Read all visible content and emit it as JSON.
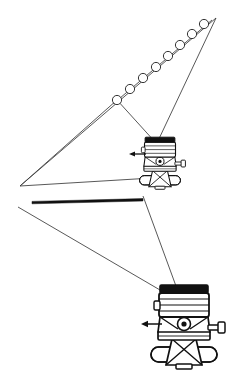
{
  "figure": {
    "background_color": "#ffffff",
    "ink_color": "#1a1a1a",
    "thin_line_color": "#3a3a3a",
    "width": 238,
    "height": 375
  },
  "upper_assembly": {
    "name": "upper sighting fan",
    "apex_label": "upper-right apex",
    "apex": {
      "x": 216,
      "y": 18
    },
    "left_vertex": {
      "x": 20,
      "y": 186
    },
    "station_point": {
      "x": 156,
      "y": 143
    },
    "target_chain_start": {
      "x": 117,
      "y": 100
    },
    "sight_lines": [
      {
        "from_x": 216,
        "from_y": 18,
        "to_x": 20,
        "to_y": 186
      },
      {
        "from_x": 216,
        "from_y": 18,
        "to_x": 156,
        "to_y": 143
      },
      {
        "from_x": 117,
        "from_y": 100,
        "to_x": 156,
        "to_y": 143
      },
      {
        "from_x": 117,
        "from_y": 100,
        "to_x": 20,
        "to_y": 186
      }
    ],
    "targets": {
      "label": "circular sighting targets",
      "count": 8,
      "radius": 4.6,
      "points": [
        {
          "x": 117,
          "y": 100
        },
        {
          "x": 130,
          "y": 89
        },
        {
          "x": 143,
          "y": 78
        },
        {
          "x": 156,
          "y": 67
        },
        {
          "x": 168,
          "y": 56
        },
        {
          "x": 180,
          "y": 45
        },
        {
          "x": 192,
          "y": 34
        },
        {
          "x": 204,
          "y": 24
        }
      ]
    }
  },
  "lower_assembly": {
    "name": "lower sighting fan",
    "left_vertex": {
      "x": 18,
      "y": 207
    },
    "upper_vertex": {
      "x": 143,
      "y": 196
    },
    "station_point": {
      "x": 172,
      "y": 297
    },
    "sight_lines": [
      {
        "from_x": 18,
        "from_y": 207,
        "to_x": 172,
        "to_y": 297
      },
      {
        "from_x": 143,
        "from_y": 196,
        "to_x": 178,
        "to_y": 297
      }
    ]
  },
  "baseline_bar": {
    "name": "heavy baseline rule",
    "left_x": 32,
    "right_x": 143,
    "y": 200,
    "thickness": 2.6,
    "color": "#111111"
  },
  "instruments": [
    {
      "id": "upper-theodolite",
      "label": "theodolite (upper station)",
      "center_x": 160,
      "center_y": 162,
      "scale": 0.62,
      "direction_arrow": {
        "label": "line-of-sight direction arrow",
        "direction": "left",
        "tip_x": 130,
        "tail_x": 146,
        "y": 154
      }
    },
    {
      "id": "lower-theodolite",
      "label": "theodolite (lower station)",
      "center_x": 184,
      "center_y": 325,
      "scale": 1.0,
      "direction_arrow": {
        "label": "line-of-sight direction arrow",
        "direction": "left",
        "tip_x": 142,
        "tail_x": 162,
        "y": 324
      }
    }
  ],
  "instrument_parts": [
    "telescope-cap",
    "telescope-barrel",
    "alidade-body",
    "horizontal-circle",
    "focus-knob",
    "tangent-screw",
    "tribrach",
    "levelling-base"
  ],
  "colors": {
    "dark_cap": "#111111",
    "body_fill": "#ffffff",
    "shade_fill": "#d8d8d8",
    "outline": "#111111"
  }
}
